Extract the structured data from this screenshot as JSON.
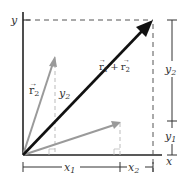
{
  "diagram": {
    "axes": {
      "x_label": "x",
      "y_label": "y"
    },
    "vectors": {
      "r1": {
        "label": "r⃗1",
        "base": "r",
        "sub": "1",
        "color": "#9a9a9a"
      },
      "r2": {
        "label": "r⃗2",
        "base": "r",
        "sub": "2",
        "color": "#9a9a9a"
      },
      "sum": {
        "label": "r⃗1 + r⃗2",
        "base1": "r",
        "sub1": "1",
        "plus": "+",
        "base2": "r",
        "sub2": "2",
        "color": "#111111"
      }
    },
    "components": {
      "x1": {
        "base": "x",
        "sub": "1"
      },
      "x2": {
        "base": "x",
        "sub": "2"
      },
      "y1": {
        "base": "y",
        "sub": "1"
      },
      "y2_right": {
        "base": "y",
        "sub": "2"
      },
      "y2_inner": {
        "base": "y",
        "sub": "2"
      }
    },
    "colors": {
      "axis": "#222222",
      "dashed": "#555555",
      "light_dashed": "#bbbbbb",
      "component_vector": "#9a9a9a",
      "resultant": "#111111"
    }
  }
}
